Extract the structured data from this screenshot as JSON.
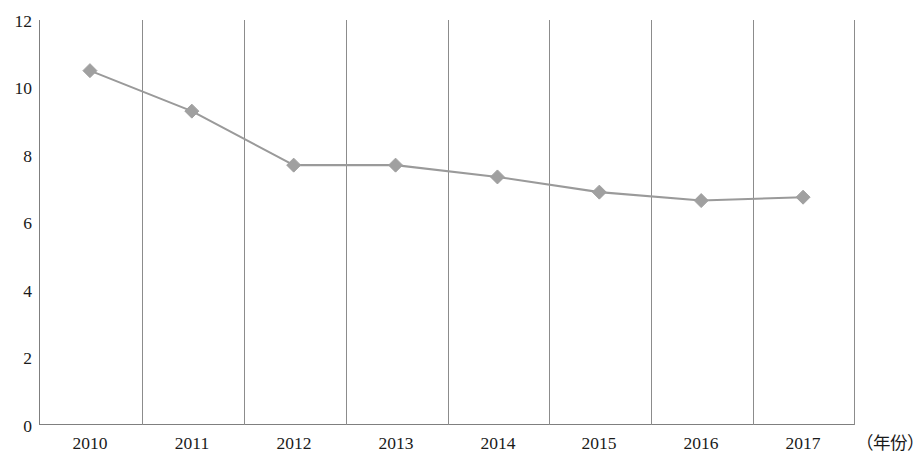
{
  "chart_data": {
    "type": "line",
    "title": "",
    "subtitle": "",
    "xlabel": "（年份）",
    "ylabel": "",
    "categories": [
      "2010",
      "2011",
      "2012",
      "2013",
      "2014",
      "2015",
      "2016",
      "2017"
    ],
    "values": [
      10.5,
      9.3,
      7.7,
      7.7,
      7.35,
      6.9,
      6.65,
      6.75
    ],
    "series": [
      {
        "name": "",
        "values": [
          10.5,
          9.3,
          7.7,
          7.7,
          7.35,
          6.9,
          6.65,
          6.75
        ]
      }
    ],
    "ylim": [
      0,
      12
    ],
    "y_ticks": [
      "0",
      "2",
      "4",
      "6",
      "8",
      "10",
      "12"
    ],
    "y_tick_values": [
      0,
      2,
      4,
      6,
      8,
      10,
      12
    ],
    "grid": "vertical-category-boundaries",
    "legend": "none",
    "marker": "diamond",
    "line_color": "#9a9a9a",
    "marker_color": "#a0a0a0",
    "axis_color": "#7f7f7f",
    "grid_color": "#8c8c8c",
    "text_color": "#1a1a1a",
    "annotations": []
  },
  "axes": {
    "y_tick_labels": [
      "12",
      "10",
      "8",
      "6",
      "4",
      "2",
      "0"
    ],
    "x_tick_labels": [
      "2010",
      "2011",
      "2012",
      "2013",
      "2014",
      "2015",
      "2016",
      "2017"
    ],
    "x_unit_label": "（年份）"
  }
}
